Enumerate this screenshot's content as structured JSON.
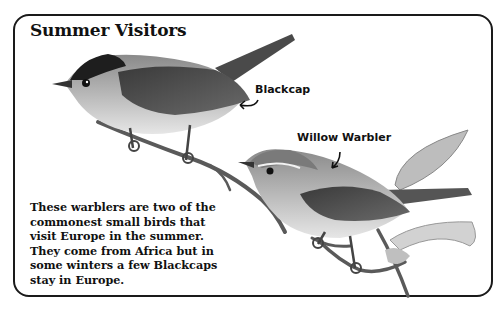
{
  "page": {
    "title": "Summer Visitors",
    "labels": {
      "blackcap": "Blackcap",
      "willow_warbler": "Willow Warbler"
    },
    "body_text": "These warblers are two of the\ncommonest small birds that\nvisit Europe in the summer.\nThey come from Africa but in\nsome winters a few Blackcaps\nstay in Europe.",
    "illustrations": [
      {
        "name": "blackcap-bird",
        "description": "Grey warbler with black cap perched on a twig"
      },
      {
        "name": "willow-warbler-bird",
        "description": "Pale warbler with eye stripe perched on a leafy twig"
      }
    ]
  }
}
